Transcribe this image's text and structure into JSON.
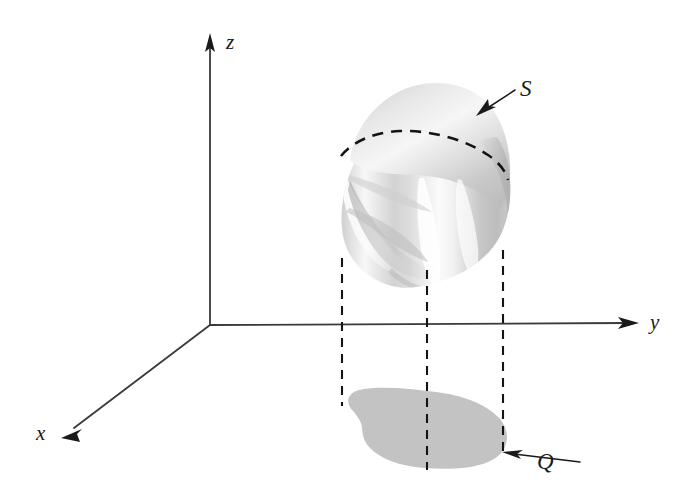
{
  "figure": {
    "background_color": "#ffffff",
    "width": 698,
    "height": 493
  },
  "axes": {
    "origin": {
      "x": 210,
      "y": 325
    },
    "items": [
      {
        "name": "z",
        "label": "z",
        "label_x": 226,
        "label_y": 49,
        "direction": "up",
        "tip_x": 210,
        "tip_y": 35,
        "color": "#3a3a3a"
      },
      {
        "name": "y",
        "label": "y",
        "label_x": 650,
        "label_y": 329,
        "direction": "right",
        "tip_x": 637,
        "tip_y": 323,
        "color": "#3a3a3a"
      },
      {
        "name": "x",
        "label": "x",
        "label_x": 36,
        "label_y": 440,
        "direction": "down-left",
        "tip_x": 62,
        "tip_y": 437,
        "color": "#3a3a3a"
      }
    ]
  },
  "surface": {
    "name": "S",
    "label": "S",
    "label_x": 520,
    "label_y": 96,
    "pointer_from_x": 515,
    "pointer_from_y": 90,
    "pointer_to_x": 478,
    "pointer_to_y": 114,
    "fill_light": "#fdfdfd",
    "fill_mid": "#d8d8d8",
    "fill_dark": "#b4b4b4",
    "bounds": {
      "left": 337,
      "top": 85,
      "right": 513,
      "bottom": 287
    },
    "silhouette_label": "dashed equator curve"
  },
  "region": {
    "name": "Q",
    "label": "Q",
    "label_x": 537,
    "label_y": 469,
    "pointer_from_x": 580,
    "pointer_from_y": 462,
    "pointer_to_x": 503,
    "pointer_to_y": 452,
    "fill": "#c3c3c3",
    "bounds": {
      "left": 344,
      "top": 388,
      "right": 508,
      "bottom": 470
    }
  },
  "projectors": {
    "color": "#151515",
    "dash_pattern": "9 7",
    "lines": [
      {
        "name": "projector-left",
        "x": 342,
        "y_top": 258,
        "y_bottom": 406
      },
      {
        "name": "projector-middle",
        "x": 427,
        "y_top": 270,
        "y_bottom": 470
      },
      {
        "name": "projector-right",
        "x": 503,
        "y_top": 250,
        "y_bottom": 452
      }
    ]
  }
}
